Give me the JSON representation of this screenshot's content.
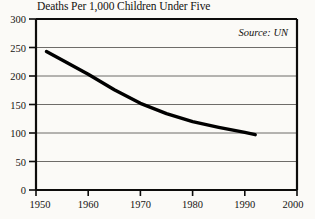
{
  "chart_data": {
    "type": "line",
    "title": "Deaths Per 1,000 Children Under Five",
    "xlabel": "",
    "ylabel": "",
    "xlim": [
      1950,
      2000
    ],
    "ylim": [
      0,
      300
    ],
    "grid": true,
    "legend": "none",
    "annotation": "Source: UN",
    "x_ticks": [
      1950,
      1960,
      1970,
      1980,
      1990,
      2000
    ],
    "y_ticks": [
      0,
      50,
      100,
      150,
      200,
      250,
      300
    ],
    "series": [
      {
        "name": "Deaths Per 1,000 Children Under Five",
        "color": "#000000",
        "x": [
          1952,
          1955,
          1960,
          1965,
          1970,
          1975,
          1980,
          1985,
          1990,
          1992
        ],
        "values": [
          243,
          228,
          203,
          176,
          152,
          134,
          120,
          110,
          101,
          97
        ]
      }
    ]
  },
  "axis": {
    "y_tick_labels": [
      "300",
      "250",
      "200",
      "150",
      "100",
      "50",
      "0"
    ],
    "x_tick_labels": [
      "1950",
      "1960",
      "1970",
      "1980",
      "1990",
      "2000"
    ]
  },
  "source": {
    "text": "Source: UN"
  }
}
